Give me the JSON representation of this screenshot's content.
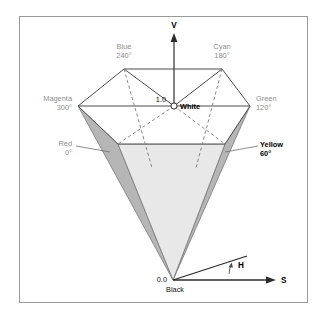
{
  "figure": {
    "title_semantic": "hsv-hexcone-diagram",
    "axes": {
      "v_axis_label": "V",
      "s_axis_label": "S",
      "h_angle_label": "H"
    },
    "value_scale": {
      "top": "1.0",
      "bottom": "0.0"
    },
    "apex_label": "Black",
    "center_label": "White",
    "hues": [
      {
        "name": "Blue",
        "angle": "240°",
        "style": "gray"
      },
      {
        "name": "Cyan",
        "angle": "180°",
        "style": "gray"
      },
      {
        "name": "Magenta",
        "angle": "300°",
        "style": "gray"
      },
      {
        "name": "Green",
        "angle": "120°",
        "style": "gray"
      },
      {
        "name": "Red",
        "angle": "0°",
        "style": "gray"
      },
      {
        "name": "Yellow",
        "angle": "60°",
        "style": "bold"
      }
    ],
    "colors": {
      "frame_border": "#9a9a9a",
      "outline": "#4d4d4d",
      "face_dark": "#b6b6b6",
      "face_light": "#e2e2e2",
      "background": "#ffffff",
      "label_gray": "#8d8d8d",
      "label_black": "#000000"
    },
    "geometry": {
      "hex_vertices": {
        "blue": [
          124,
          69
        ],
        "cyan": [
          222,
          69
        ],
        "green": [
          250,
          106
        ],
        "yellow": [
          225,
          144
        ],
        "red": [
          118,
          144
        ],
        "magenta": [
          78,
          106
        ]
      },
      "apex": [
        173,
        280
      ],
      "white_center": [
        174,
        106
      ]
    }
  }
}
